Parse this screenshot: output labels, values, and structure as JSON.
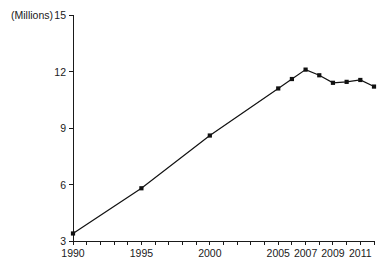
{
  "chart_data": {
    "type": "line",
    "title": "",
    "subtitle": "",
    "xlabel": "",
    "ylabel": "",
    "unit_label": "(Millions)",
    "grid": false,
    "legend": false,
    "legend_position": "none",
    "xlim": [
      1989.5,
      2012.5
    ],
    "ylim": [
      3,
      15
    ],
    "y_ticks": [
      3,
      6,
      9,
      12,
      15
    ],
    "y_tick_labels": [
      "3",
      "6",
      "9",
      "12",
      "15"
    ],
    "x_ticks": [
      1990,
      1991,
      1992,
      1993,
      1994,
      1995,
      1996,
      1997,
      1998,
      1999,
      2000,
      2001,
      2002,
      2003,
      2004,
      2005,
      2006,
      2007,
      2008,
      2009,
      2010,
      2011,
      2012
    ],
    "x_tick_labels_shown": [
      "1990",
      "1995",
      "2000",
      "2005",
      "2007",
      "2009",
      "2011"
    ],
    "x_labeled_ticks": [
      1990,
      1995,
      2000,
      2005,
      2007,
      2009,
      2011
    ],
    "x": [
      1990,
      1995,
      2000,
      2005,
      2006,
      2007,
      2008,
      2009,
      2010,
      2011,
      2012
    ],
    "values": [
      3.4,
      5.8,
      8.6,
      11.1,
      11.6,
      12.1,
      11.8,
      11.4,
      11.45,
      11.55,
      11.2
    ],
    "series": [
      {
        "name": "series-1",
        "marker": "square",
        "color": "#111111",
        "values": [
          3.4,
          5.8,
          8.6,
          11.1,
          11.6,
          12.1,
          11.8,
          11.4,
          11.45,
          11.55,
          11.2
        ]
      }
    ],
    "annotations": []
  },
  "axes": {
    "unit_caption": "(Millions)"
  }
}
